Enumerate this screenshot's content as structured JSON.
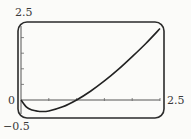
{
  "chart_data": {
    "type": "line",
    "title": "",
    "xlabel": "",
    "ylabel": "",
    "xlim": [
      0,
      2.5
    ],
    "ylim": [
      -0.5,
      2.5
    ],
    "grid": false,
    "legend": null,
    "x_tick_step": 0.5,
    "y_tick_step": 0.5,
    "tick_labels": {
      "x_max": "2.5",
      "y_max": "2.5",
      "y_min": "-0.5",
      "origin": "0"
    },
    "series": [
      {
        "name": "f(x)",
        "x": [
          0.0,
          0.1,
          0.2,
          0.3,
          0.368,
          0.5,
          0.75,
          1.0,
          1.25,
          1.5,
          1.75,
          2.0,
          2.25,
          2.5
        ],
        "y": [
          0.0,
          -0.23,
          -0.32,
          -0.36,
          -0.37,
          -0.35,
          -0.22,
          0.0,
          0.28,
          0.61,
          0.98,
          1.39,
          1.82,
          2.29
        ]
      }
    ]
  },
  "labels": {
    "y_max": "2.5",
    "y_min": "−0.5",
    "origin": "0",
    "x_max": "2.5"
  }
}
